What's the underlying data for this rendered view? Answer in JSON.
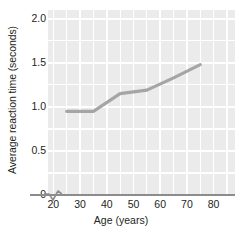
{
  "chart_data": {
    "type": "line",
    "title": "",
    "xlabel": "Age (years)",
    "ylabel": "Average reaction time (seconds)",
    "xlim": [
      18,
      88
    ],
    "ylim": [
      0,
      2.1
    ],
    "xticks": [
      20,
      30,
      40,
      50,
      60,
      70,
      80
    ],
    "xtick_labels": [
      "20",
      "30",
      "40",
      "50",
      "60",
      "70",
      "80"
    ],
    "yticks": [
      0,
      0.5,
      1.0,
      1.5,
      2.0
    ],
    "ytick_labels": [
      "0",
      "0.5",
      "1.0",
      "1.5",
      "2.0"
    ],
    "y_minor_ticks": [
      0.25,
      0.75,
      1.25,
      1.75
    ],
    "x_minor_ticks": [
      25,
      35,
      45,
      55,
      65,
      75,
      85
    ],
    "grid": true,
    "legend": "none",
    "axis_break": "x-axis zigzag between 0 and 20",
    "plot_background": "#ebebeb",
    "gridline_color": "#ffffff",
    "line_color": "#a5a5a5",
    "line_width": 3.2,
    "series": [
      {
        "name": "Average reaction time",
        "x": [
          25,
          35,
          45,
          50,
          55,
          65,
          75
        ],
        "values": [
          0.95,
          0.95,
          1.15,
          1.17,
          1.19,
          1.33,
          1.48
        ]
      }
    ]
  },
  "axis": {
    "y_title": "Average reaction time (seconds)",
    "x_title": "Age (years)"
  }
}
